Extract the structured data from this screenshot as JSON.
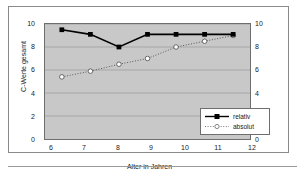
{
  "chart_data": {
    "type": "line",
    "title": "",
    "xlabel": "Alter in Jahren",
    "ylabel": "C-Werte gesamt",
    "ylabel_right": "C-Werte je Altersklasse",
    "categories": [
      6,
      7,
      8,
      9,
      10,
      11,
      12
    ],
    "x_ticks": [
      "6",
      "7",
      "8",
      "9",
      "10",
      "11",
      "12"
    ],
    "y_ticks_left": [
      "0",
      "2",
      "4",
      "6",
      "8",
      "10"
    ],
    "y_ticks_right": [
      "0",
      "2",
      "4",
      "6",
      "8",
      "10"
    ],
    "ylim": [
      0,
      10
    ],
    "ylim_right": [
      0,
      10
    ],
    "grid": true,
    "legend_position": "inside-bottom-right",
    "series": [
      {
        "name": "relativ",
        "axis": "left",
        "line_style": "solid",
        "marker": "filled-square",
        "color": "#000000",
        "values": [
          9.5,
          9.1,
          8.0,
          9.1,
          9.1,
          9.1,
          9.1
        ]
      },
      {
        "name": "absolut",
        "axis": "right",
        "line_style": "dotted",
        "marker": "open-circle",
        "color": "#ffffff",
        "values": [
          5.4,
          5.9,
          6.5,
          7.0,
          8.0,
          8.5,
          9.0
        ]
      }
    ]
  },
  "colors": {
    "plot_background": "#c8c8c8",
    "frame_border": "#8a8a8a",
    "axis_line": "#6e6e6e",
    "gridline": "#9e9e9e",
    "series_relativ": "#000000",
    "series_absolut": "#ffffff"
  }
}
